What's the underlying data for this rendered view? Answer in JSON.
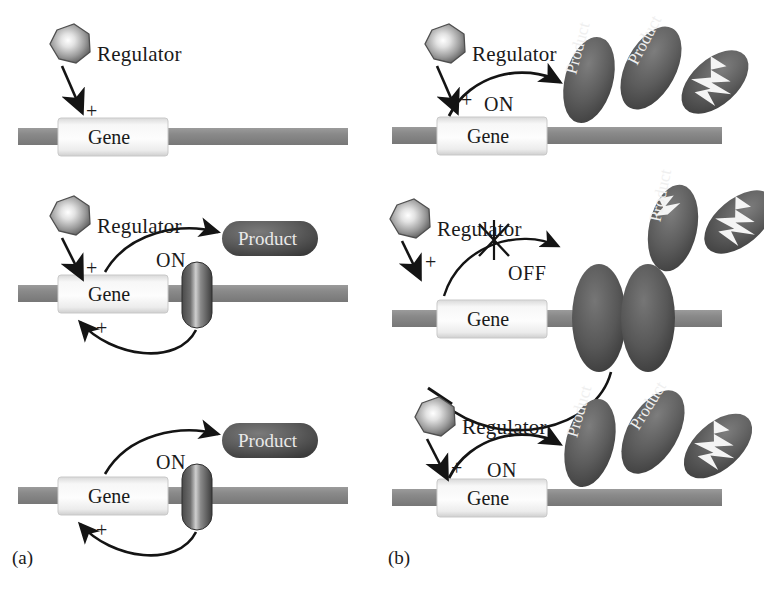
{
  "figure": {
    "background": "#ffffff",
    "ink": "#1a1a1a",
    "colors": {
      "dna_bar": "#8d8d8d",
      "dna_bar_dark": "#6f6f6f",
      "gene_box_light": "#f4f4f4",
      "gene_box_edge": "#cfcfcf",
      "protein_dark": "#5b5b5b",
      "protein_darker": "#3f3f3f",
      "protein_highlight": "#d8d8d8",
      "regulator_light": "#f2f2f2",
      "regulator_dark": "#6a6a6a",
      "arrow": "#141414",
      "product_text": "#efefef"
    }
  },
  "panels": [
    {
      "id": "a",
      "label": "(a)",
      "caption_position": "bottom-left",
      "rows": [
        {
          "id": "a1",
          "regulator": {
            "label": "Regulator",
            "shape": "heptagon",
            "bound": false
          },
          "activation_sign": "+",
          "gene": {
            "label": "Gene"
          },
          "state": null,
          "transcription_arrow": false,
          "product": null,
          "feedback": null,
          "bound_protein": null,
          "degraded_products": 0
        },
        {
          "id": "a2",
          "regulator": {
            "label": "Regulator",
            "shape": "heptagon",
            "bound": false
          },
          "activation_sign": "+",
          "gene": {
            "label": "Gene"
          },
          "state": "ON",
          "transcription_arrow": true,
          "product": {
            "label": "Product",
            "style": "pill"
          },
          "feedback": {
            "type": "positive",
            "sign": "+",
            "terminus": "arrow"
          },
          "bound_protein": {
            "shape": "capsule",
            "count": 1
          },
          "degraded_products": 0
        },
        {
          "id": "a3",
          "regulator": null,
          "activation_sign": null,
          "gene": {
            "label": "Gene"
          },
          "state": "ON",
          "transcription_arrow": true,
          "product": {
            "label": "Product",
            "style": "pill"
          },
          "feedback": {
            "type": "positive",
            "sign": "+",
            "terminus": "arrow"
          },
          "bound_protein": {
            "shape": "capsule",
            "count": 1
          },
          "degraded_products": 0
        }
      ]
    },
    {
      "id": "b",
      "label": "(b)",
      "caption_position": "bottom-left",
      "rows": [
        {
          "id": "b1",
          "regulator": {
            "label": "Regulator",
            "shape": "heptagon",
            "bound": false
          },
          "activation_sign": "+",
          "gene": {
            "label": "Gene"
          },
          "state": "ON",
          "transcription_arrow": true,
          "blocked": false,
          "products": [
            {
              "label": "Product",
              "style": "oval",
              "rotation": -75,
              "broken": false
            },
            {
              "label": "Product",
              "style": "oval",
              "rotation": -62,
              "broken": false
            },
            {
              "label": "",
              "style": "oval",
              "rotation": -40,
              "broken": true
            }
          ],
          "feedback": null,
          "bound_protein": null
        },
        {
          "id": "b2",
          "regulator": {
            "label": "Regulator",
            "shape": "heptagon",
            "bound": false
          },
          "activation_sign": "+",
          "gene": {
            "label": "Gene"
          },
          "state": "OFF",
          "transcription_arrow": true,
          "blocked": true,
          "block_mark": "x",
          "products": [
            {
              "label": "Product",
              "style": "oval",
              "rotation": -78,
              "broken": "partial"
            },
            {
              "label": "",
              "style": "oval",
              "rotation": -42,
              "broken": true
            }
          ],
          "feedback": {
            "type": "negative",
            "sign": null,
            "terminus": "t-bar"
          },
          "bound_protein": {
            "shape": "oval",
            "count": 2
          }
        },
        {
          "id": "b3",
          "regulator": {
            "label": "Regulator",
            "shape": "heptagon",
            "bound": false
          },
          "activation_sign": "+",
          "gene": {
            "label": "Gene"
          },
          "state": "ON",
          "transcription_arrow": true,
          "blocked": false,
          "products": [
            {
              "label": "Product",
              "style": "oval",
              "rotation": -74,
              "broken": false
            },
            {
              "label": "Product",
              "style": "oval",
              "rotation": -58,
              "broken": false
            },
            {
              "label": "",
              "style": "oval",
              "rotation": -40,
              "broken": true
            }
          ],
          "feedback": null,
          "bound_protein": null
        }
      ]
    }
  ]
}
